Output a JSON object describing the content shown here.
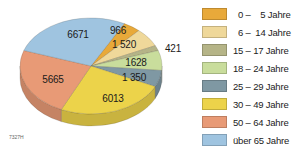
{
  "chart_data": {
    "type": "pie",
    "title": "",
    "unit": "",
    "categories": [
      "0 – 5 Jahre",
      "6 – 14 Jahre",
      "15 – 17 Jahre",
      "18 – 24 Jahre",
      "25 – 29 Jahre",
      "30 – 49 Jahre",
      "50 – 64 Jahre",
      "über 65 Jahre"
    ],
    "values": [
      966,
      1520,
      421,
      1628,
      1350,
      6013,
      5665,
      6671
    ],
    "value_labels": [
      "966",
      "1 520",
      "421",
      "1628",
      "1 350",
      "6013",
      "5665",
      "6671"
    ],
    "colors": [
      "#e8a93a",
      "#efd89a",
      "#b5b487",
      "#c9dd9c",
      "#7f98a3",
      "#ecd34a",
      "#e89a76",
      "#9fc4e0"
    ],
    "legend_position": "right",
    "style": "3d-tilted-pie"
  },
  "legend": {
    "items": [
      {
        "label": "  0 –    5 Jahre",
        "color": "#e8a93a"
      },
      {
        "label": "  6 –  14 Jahre",
        "color": "#efd89a"
      },
      {
        "label": "15 – 17 Jahre",
        "color": "#b5b487"
      },
      {
        "label": "18 – 24 Jahre",
        "color": "#c9dd9c"
      },
      {
        "label": "25 – 29 Jahre",
        "color": "#7f98a3"
      },
      {
        "label": "30 – 49 Jahre",
        "color": "#ecd34a"
      },
      {
        "label": "50 – 64 Jahre",
        "color": "#e89a76"
      },
      {
        "label": "über 65 Jahre",
        "color": "#9fc4e0"
      }
    ]
  },
  "figure_code": "7327H"
}
